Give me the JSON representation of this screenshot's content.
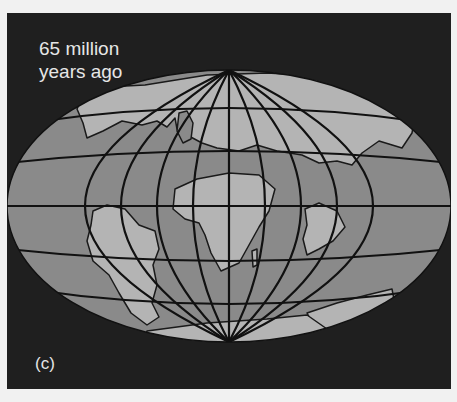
{
  "figure": {
    "caption": "65 million\nyears ago",
    "panel_label": "(c)",
    "colors": {
      "background_frame": "#1f1f1f",
      "ocean": "#8a8a8a",
      "land": "#b4b4b4",
      "grid_lines": "#111111",
      "text": "#e6e6e6",
      "page": "#f1f1f1"
    },
    "landmasses": [
      "North America / Eurasia (northern)",
      "South America",
      "Africa",
      "India",
      "Australia",
      "Antarctica"
    ]
  }
}
